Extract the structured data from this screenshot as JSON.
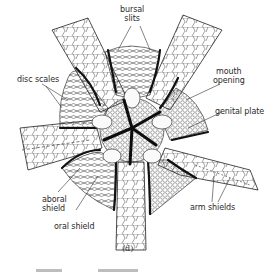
{
  "figure": {
    "panel_label": "(d)",
    "labels": {
      "bursal_slits": [
        "bursal",
        "slits"
      ],
      "disc_scales": "disc scales",
      "mouth_opening": [
        "mouth",
        "opening"
      ],
      "genital_plate": "genital plate",
      "aboral_shield": [
        "aboral",
        "shield"
      ],
      "oral_shield": "oral shield",
      "arm_shields": "arm shields"
    },
    "colors": {
      "ink": "#1a1a1a",
      "background": "#ffffff",
      "label_text": "#2a2a2a"
    }
  }
}
